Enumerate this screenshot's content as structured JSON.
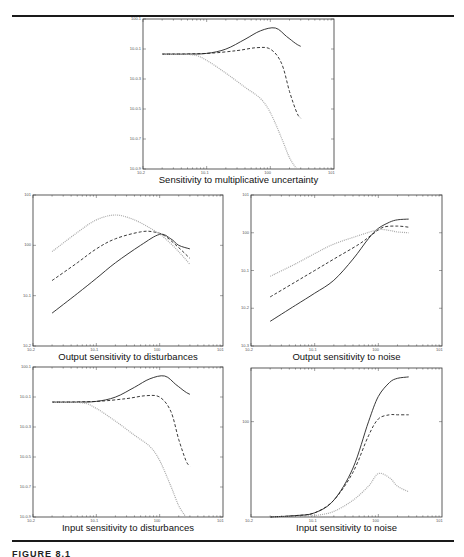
{
  "figure": {
    "caption": "FIGURE 8.1",
    "rules": [
      {
        "y": 16
      },
      {
        "y": 541
      }
    ]
  },
  "chart_data": [
    {
      "id": "top",
      "type": "line",
      "title": "Sensitivity to multiplicative uncertainty",
      "xscale": "log",
      "yscale": "log",
      "xlim": [
        0.01,
        10
      ],
      "x_ticks": [
        "10^-2",
        "10^-1",
        "10^0",
        "10^1"
      ],
      "y_ticks": [
        "10^0.1",
        "10^-0.1",
        "10^-0.3",
        "10^-0.5",
        "10^-0.7",
        "10^-0.9"
      ],
      "frame": {
        "x": 143,
        "y": 19,
        "w": 191,
        "h": 150
      },
      "series": [
        {
          "name": "solid",
          "style": "solid",
          "color": "#222222",
          "points": [
            [
              0.02,
              0.185
            ],
            [
              0.05,
              0.185
            ],
            [
              0.1,
              0.18
            ],
            [
              0.2,
              0.15
            ],
            [
              0.4,
              0.08
            ],
            [
              0.7,
              0.02
            ],
            [
              1.2,
              0.0
            ],
            [
              1.8,
              0.06
            ],
            [
              2.5,
              0.11
            ],
            [
              3,
              0.13
            ]
          ]
        },
        {
          "name": "dashed",
          "style": "dashed",
          "color": "#222222",
          "points": [
            [
              0.02,
              0.185
            ],
            [
              0.1,
              0.18
            ],
            [
              0.3,
              0.16
            ],
            [
              0.6,
              0.14
            ],
            [
              1.0,
              0.15
            ],
            [
              1.5,
              0.25
            ],
            [
              2.0,
              0.45
            ],
            [
              2.6,
              0.6
            ],
            [
              3,
              0.64
            ]
          ]
        },
        {
          "name": "dotted",
          "style": "dotted",
          "color": "#aaaaaa",
          "points": [
            [
              0.02,
              0.185
            ],
            [
              0.06,
              0.19
            ],
            [
              0.1,
              0.23
            ],
            [
              0.2,
              0.32
            ],
            [
              0.4,
              0.42
            ],
            [
              0.7,
              0.5
            ],
            [
              1.0,
              0.6
            ],
            [
              1.5,
              0.78
            ],
            [
              2.0,
              0.92
            ],
            [
              2.6,
              1.0
            ]
          ]
        }
      ]
    },
    {
      "id": "mid-left",
      "type": "line",
      "title": "Output sensitivity to disturbances",
      "xscale": "log",
      "yscale": "log",
      "xlim": [
        0.01,
        10
      ],
      "ylim": [
        0.01,
        10
      ],
      "x_ticks": [
        "10^-2",
        "10^-1",
        "10^0",
        "10^1"
      ],
      "y_ticks": [
        "10^1",
        "10^0",
        "10^-1",
        "10^-2"
      ],
      "frame": {
        "x": 33,
        "y": 195,
        "w": 190,
        "h": 151
      },
      "series": [
        {
          "name": "solid",
          "style": "solid",
          "color": "#222222",
          "points": [
            [
              0.02,
              0.045
            ],
            [
              0.05,
              0.11
            ],
            [
              0.1,
              0.22
            ],
            [
              0.2,
              0.45
            ],
            [
              0.5,
              1.0
            ],
            [
              1.0,
              1.65
            ],
            [
              1.5,
              1.35
            ],
            [
              2.0,
              1.0
            ],
            [
              3,
              0.85
            ]
          ]
        },
        {
          "name": "dashed",
          "style": "dashed",
          "color": "#222222",
          "points": [
            [
              0.02,
              0.2
            ],
            [
              0.05,
              0.45
            ],
            [
              0.1,
              0.85
            ],
            [
              0.2,
              1.35
            ],
            [
              0.5,
              1.85
            ],
            [
              0.8,
              1.85
            ],
            [
              1.2,
              1.55
            ],
            [
              2.0,
              0.9
            ],
            [
              3,
              0.55
            ]
          ]
        },
        {
          "name": "dotted",
          "style": "dotted",
          "color": "#aaaaaa",
          "points": [
            [
              0.02,
              0.75
            ],
            [
              0.05,
              1.8
            ],
            [
              0.1,
              3.2
            ],
            [
              0.2,
              4.0
            ],
            [
              0.4,
              3.2
            ],
            [
              0.8,
              2.0
            ],
            [
              1.2,
              1.4
            ],
            [
              2.0,
              0.75
            ],
            [
              3,
              0.42
            ]
          ]
        }
      ]
    },
    {
      "id": "mid-right",
      "type": "line",
      "title": "Output sensitivity to noise",
      "xscale": "log",
      "yscale": "log",
      "xlim": [
        0.01,
        10
      ],
      "ylim": [
        0.001,
        10
      ],
      "x_ticks": [
        "10^-2",
        "10^-1",
        "10^0",
        "10^1"
      ],
      "y_ticks": [
        "10^1",
        "10^0",
        "10^-1",
        "10^-2",
        "10^-3"
      ],
      "frame": {
        "x": 251,
        "y": 195,
        "w": 191,
        "h": 151
      },
      "series": [
        {
          "name": "solid",
          "style": "solid",
          "color": "#222222",
          "points": [
            [
              0.02,
              0.0045
            ],
            [
              0.05,
              0.012
            ],
            [
              0.1,
              0.025
            ],
            [
              0.2,
              0.055
            ],
            [
              0.4,
              0.2
            ],
            [
              0.7,
              0.7
            ],
            [
              1.0,
              1.3
            ],
            [
              1.5,
              1.9
            ],
            [
              2.0,
              2.2
            ],
            [
              3,
              2.3
            ]
          ]
        },
        {
          "name": "dashed",
          "style": "dashed",
          "color": "#222222",
          "points": [
            [
              0.02,
              0.02
            ],
            [
              0.05,
              0.05
            ],
            [
              0.1,
              0.1
            ],
            [
              0.2,
              0.2
            ],
            [
              0.5,
              0.5
            ],
            [
              0.8,
              0.9
            ],
            [
              1.2,
              1.4
            ],
            [
              2.0,
              1.5
            ],
            [
              3,
              1.4
            ]
          ]
        },
        {
          "name": "dotted",
          "style": "dotted",
          "color": "#aaaaaa",
          "points": [
            [
              0.02,
              0.07
            ],
            [
              0.05,
              0.15
            ],
            [
              0.1,
              0.28
            ],
            [
              0.2,
              0.5
            ],
            [
              0.5,
              0.85
            ],
            [
              1.0,
              1.2
            ],
            [
              1.5,
              1.15
            ],
            [
              2.0,
              1.05
            ],
            [
              3,
              1.0
            ]
          ]
        }
      ]
    },
    {
      "id": "bottom-left",
      "type": "line",
      "title": "Input sensitivity to disturbances",
      "xscale": "log",
      "yscale": "log",
      "xlim": [
        0.01,
        10
      ],
      "x_ticks": [
        "10^-2",
        "10^-1",
        "10^0",
        "10^1"
      ],
      "y_ticks": [
        "10^0.1",
        "10^-0.1",
        "10^-0.3",
        "10^-0.5",
        "10^-0.7",
        "10^-0.9"
      ],
      "frame": {
        "x": 33,
        "y": 367,
        "w": 190,
        "h": 150
      },
      "series": [
        {
          "name": "solid",
          "style": "solid",
          "color": "#222222",
          "points": [
            [
              0.02,
              0.185
            ],
            [
              0.05,
              0.185
            ],
            [
              0.1,
              0.18
            ],
            [
              0.2,
              0.15
            ],
            [
              0.4,
              0.08
            ],
            [
              0.7,
              0.02
            ],
            [
              1.2,
              0.0
            ],
            [
              1.8,
              0.06
            ],
            [
              2.5,
              0.11
            ],
            [
              3,
              0.13
            ]
          ]
        },
        {
          "name": "dashed",
          "style": "dashed",
          "color": "#222222",
          "points": [
            [
              0.02,
              0.185
            ],
            [
              0.1,
              0.18
            ],
            [
              0.3,
              0.16
            ],
            [
              0.6,
              0.14
            ],
            [
              1.0,
              0.15
            ],
            [
              1.5,
              0.25
            ],
            [
              2.0,
              0.45
            ],
            [
              2.6,
              0.6
            ],
            [
              3,
              0.64
            ]
          ]
        },
        {
          "name": "dotted",
          "style": "dotted",
          "color": "#aaaaaa",
          "points": [
            [
              0.02,
              0.185
            ],
            [
              0.06,
              0.19
            ],
            [
              0.1,
              0.23
            ],
            [
              0.2,
              0.32
            ],
            [
              0.4,
              0.42
            ],
            [
              0.7,
              0.5
            ],
            [
              1.0,
              0.6
            ],
            [
              1.5,
              0.78
            ],
            [
              2.0,
              0.92
            ],
            [
              2.6,
              1.0
            ]
          ]
        }
      ]
    },
    {
      "id": "bottom-right",
      "type": "line",
      "title": "Input sensitivity to noise",
      "xscale": "log",
      "yscale": "log",
      "xlim": [
        0.01,
        10
      ],
      "x_ticks": [
        "10^-2",
        "10^-1",
        "10^0",
        "10^1"
      ],
      "y_ticks": [
        "10^0"
      ],
      "frame": {
        "x": 251,
        "y": 368,
        "w": 191,
        "h": 149
      },
      "series": [
        {
          "name": "solid",
          "style": "solid",
          "color": "#222222",
          "points": [
            [
              0.02,
              1.0
            ],
            [
              0.05,
              0.99
            ],
            [
              0.1,
              0.97
            ],
            [
              0.2,
              0.88
            ],
            [
              0.4,
              0.65
            ],
            [
              0.7,
              0.32
            ],
            [
              1.0,
              0.14
            ],
            [
              1.5,
              0.04
            ],
            [
              2.0,
              0.01
            ],
            [
              3,
              0.0
            ]
          ]
        },
        {
          "name": "dashed",
          "style": "dashed",
          "color": "#222222",
          "points": [
            [
              0.02,
              1.0
            ],
            [
              0.05,
              0.99
            ],
            [
              0.1,
              0.97
            ],
            [
              0.2,
              0.88
            ],
            [
              0.4,
              0.68
            ],
            [
              0.7,
              0.42
            ],
            [
              1.0,
              0.3
            ],
            [
              1.5,
              0.27
            ],
            [
              2.0,
              0.27
            ],
            [
              3,
              0.27
            ]
          ]
        },
        {
          "name": "dotted",
          "style": "dotted",
          "color": "#aaaaaa",
          "points": [
            [
              0.02,
              1.0
            ],
            [
              0.05,
              1.0
            ],
            [
              0.1,
              0.99
            ],
            [
              0.2,
              0.96
            ],
            [
              0.4,
              0.88
            ],
            [
              0.7,
              0.78
            ],
            [
              1.0,
              0.69
            ],
            [
              1.5,
              0.72
            ],
            [
              2.0,
              0.78
            ],
            [
              3,
              0.82
            ]
          ]
        }
      ]
    }
  ]
}
